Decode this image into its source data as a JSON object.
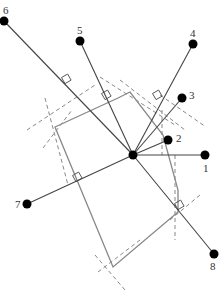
{
  "diagram": {
    "title": "",
    "center": {
      "x": 133,
      "y": 155
    },
    "colors": {
      "spoke": "#444444",
      "polygon": "#888888",
      "dashed": "#888888",
      "point": "#000000",
      "label": "#333333"
    },
    "points": [
      {
        "id": "1",
        "label": "1",
        "x": 205,
        "y": 155,
        "lx": 203,
        "ly": 172
      },
      {
        "id": "2",
        "label": "2",
        "x": 168,
        "y": 140,
        "lx": 176,
        "ly": 142
      },
      {
        "id": "3",
        "label": "3",
        "x": 182,
        "y": 98,
        "lx": 189,
        "ly": 99
      },
      {
        "id": "4",
        "label": "4",
        "x": 193,
        "y": 44,
        "lx": 190,
        "ly": 37
      },
      {
        "id": "5",
        "label": "5",
        "x": 80,
        "y": 41,
        "lx": 77,
        "ly": 34
      },
      {
        "id": "6",
        "label": "6",
        "x": 4,
        "y": 21,
        "lx": 3,
        "ly": 14
      },
      {
        "id": "7",
        "label": "7",
        "x": 27,
        "y": 204,
        "lx": 15,
        "ly": 208
      },
      {
        "id": "8",
        "label": "8",
        "x": 214,
        "y": 254,
        "lx": 210,
        "ly": 270
      }
    ],
    "polygon": [
      [
        55,
        127
      ],
      [
        118,
        98
      ],
      [
        130,
        92
      ],
      [
        163,
        135
      ],
      [
        178,
        190
      ],
      [
        178,
        212
      ],
      [
        113,
        267
      ]
    ],
    "dashed_lines": [
      [
        [
          27,
          130
        ],
        [
          95,
          85
        ]
      ],
      [
        [
          43,
          148
        ],
        [
          72,
          110
        ]
      ],
      [
        [
          45,
          98
        ],
        [
          68,
          185
        ]
      ],
      [
        [
          100,
          77
        ],
        [
          175,
          125
        ]
      ],
      [
        [
          120,
          80
        ],
        [
          185,
          130
        ]
      ],
      [
        [
          160,
          95
        ],
        [
          206,
          127
        ]
      ],
      [
        [
          162,
          110
        ],
        [
          162,
          155
        ]
      ],
      [
        [
          175,
          155
        ],
        [
          175,
          240
        ]
      ],
      [
        [
          95,
          255
        ],
        [
          125,
          290
        ]
      ],
      [
        [
          98,
          272
        ],
        [
          140,
          240
        ]
      ],
      [
        [
          170,
          220
        ],
        [
          200,
          195
        ]
      ]
    ],
    "right_angle_marks": [
      {
        "x": 67,
        "y": 79
      },
      {
        "x": 107,
        "y": 95
      },
      {
        "x": 158,
        "y": 95
      },
      {
        "x": 78,
        "y": 177
      },
      {
        "x": 180,
        "y": 205
      }
    ]
  }
}
